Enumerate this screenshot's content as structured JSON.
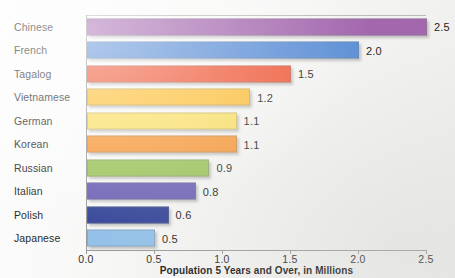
{
  "chart_data": {
    "type": "bar",
    "orientation": "horizontal",
    "title": "",
    "xlabel": "Population 5 Years and Over, in Millions",
    "ylabel": "",
    "xlim": [
      0.0,
      2.5
    ],
    "xticks": [
      "0.0",
      "0.5",
      "1.0",
      "1.5",
      "2.0",
      "2.5"
    ],
    "xtick_values": [
      0.0,
      0.5,
      1.0,
      1.5,
      2.0,
      2.5
    ],
    "grid": false,
    "legend": "none",
    "categories": [
      "Chinese",
      "French",
      "Tagalog",
      "Vietnamese",
      "German",
      "Korean",
      "Russian",
      "Italian",
      "Polish",
      "Japanese"
    ],
    "values": [
      2.5,
      2.0,
      1.5,
      1.2,
      1.1,
      1.1,
      0.9,
      0.8,
      0.6,
      0.5
    ],
    "value_labels": [
      "2.5",
      "2.0",
      "1.5",
      "1.2",
      "1.1",
      "1.1",
      "0.9",
      "0.8",
      "0.6",
      "0.5"
    ],
    "colors": [
      "#a367ae",
      "#5b8ed6",
      "#ef5c3c",
      "#fcc13e",
      "#fae06a",
      "#f79a3c",
      "#9cc45b",
      "#6e63b6",
      "#37479a",
      "#93c1ea"
    ],
    "bars": [
      {
        "category": "Chinese",
        "value": 2.5,
        "label": "2.5",
        "color": "#a367ae"
      },
      {
        "category": "French",
        "value": 2.0,
        "label": "2.0",
        "color": "#5b8ed6"
      },
      {
        "category": "Tagalog",
        "value": 1.5,
        "label": "1.5",
        "color": "#ef5c3c"
      },
      {
        "category": "Vietnamese",
        "value": 1.2,
        "label": "1.2",
        "color": "#fcc13e"
      },
      {
        "category": "German",
        "value": 1.1,
        "label": "1.1",
        "color": "#fae06a"
      },
      {
        "category": "Korean",
        "value": 1.1,
        "label": "1.1",
        "color": "#f79a3c"
      },
      {
        "category": "Russian",
        "value": 0.9,
        "label": "0.9",
        "color": "#9cc45b"
      },
      {
        "category": "Italian",
        "value": 0.8,
        "label": "0.8",
        "color": "#6e63b6"
      },
      {
        "category": "Polish",
        "value": 0.6,
        "label": "0.6",
        "color": "#37479a"
      },
      {
        "category": "Japanese",
        "value": 0.5,
        "label": "0.5",
        "color": "#93c1ea"
      }
    ]
  }
}
